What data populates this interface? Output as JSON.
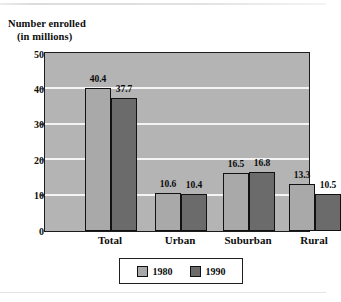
{
  "chart_data": {
    "type": "bar",
    "title": "Number enrolled (in millions)",
    "title_line1": "Number enrolled",
    "title_line2": "(in millions)",
    "xlabel": "",
    "ylabel": "Number enrolled (in millions)",
    "ylim": [
      0,
      50
    ],
    "yticks": [
      0,
      10,
      20,
      30,
      40,
      50
    ],
    "ytick_labels": [
      "0",
      "10",
      "20",
      "30",
      "40",
      "50"
    ],
    "grid": true,
    "grid_axis": "y",
    "legend_position": "below-center",
    "categories": [
      "Total",
      "Urban",
      "Suburban",
      "Rural"
    ],
    "series": [
      {
        "name": "1980",
        "color": "#a9a9a9",
        "values": [
          40.4,
          10.6,
          16.5,
          13.3
        ],
        "value_labels": [
          "40.4",
          "10.6",
          "16.5",
          "13.3"
        ]
      },
      {
        "name": "1990",
        "color": "#6b6b6b",
        "values": [
          37.7,
          10.4,
          16.8,
          10.5
        ],
        "value_labels": [
          "37.7",
          "10.4",
          "16.8",
          "10.5"
        ]
      }
    ],
    "plot_background": "#b4b4b4",
    "gridline_color": "#f4f4f4",
    "axis_color": "#1c1c1c"
  },
  "legend": {
    "items": [
      {
        "label": "1980",
        "swatch": "legend-swatch-1980"
      },
      {
        "label": "1990",
        "swatch": "legend-swatch-1990"
      }
    ]
  }
}
